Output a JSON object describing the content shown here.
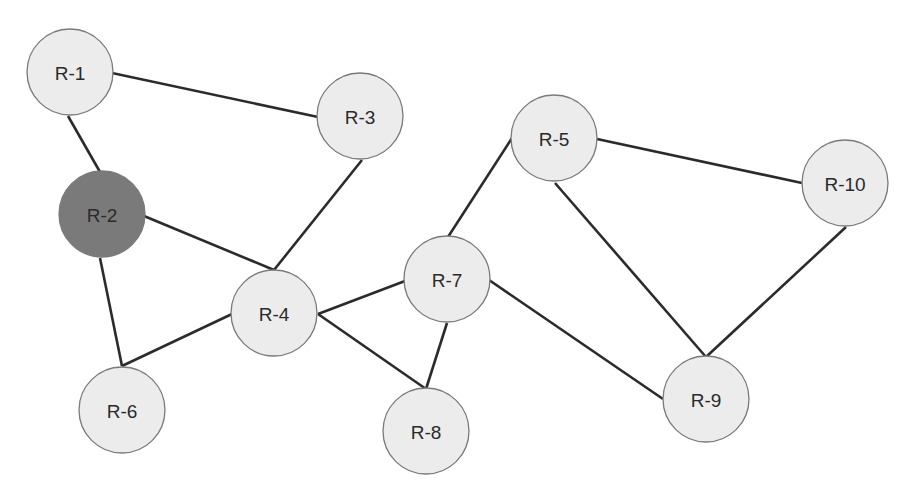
{
  "diagram": {
    "type": "network-graph",
    "colors": {
      "node_fill": "#ececec",
      "node_fill_highlighted": "#7a7a7a",
      "node_stroke": "#7a7a7a",
      "edge": "#2b2b2b",
      "label": "#2a2a2a"
    },
    "nodes": [
      {
        "id": "R-1",
        "label": "R-1",
        "x": 70,
        "y": 72,
        "highlighted": false
      },
      {
        "id": "R-2",
        "label": "R-2",
        "x": 102,
        "y": 214,
        "highlighted": true
      },
      {
        "id": "R-3",
        "label": "R-3",
        "x": 360,
        "y": 116,
        "highlighted": false
      },
      {
        "id": "R-4",
        "label": "R-4",
        "x": 274,
        "y": 313,
        "highlighted": false
      },
      {
        "id": "R-5",
        "label": "R-5",
        "x": 554,
        "y": 138,
        "highlighted": false
      },
      {
        "id": "R-6",
        "label": "R-6",
        "x": 122,
        "y": 410,
        "highlighted": false
      },
      {
        "id": "R-7",
        "label": "R-7",
        "x": 447,
        "y": 279,
        "highlighted": false
      },
      {
        "id": "R-8",
        "label": "R-8",
        "x": 426,
        "y": 431,
        "highlighted": false
      },
      {
        "id": "R-9",
        "label": "R-9",
        "x": 706,
        "y": 399,
        "highlighted": false
      },
      {
        "id": "R-10",
        "label": "R-10",
        "x": 845,
        "y": 183,
        "highlighted": false
      }
    ],
    "edges": [
      {
        "from": "R-1",
        "to": "R-2",
        "x1": 68,
        "y1": 116,
        "x2": 100,
        "y2": 172
      },
      {
        "from": "R-1",
        "to": "R-3",
        "x1": 112,
        "y1": 73,
        "x2": 318,
        "y2": 117
      },
      {
        "from": "R-2",
        "to": "R-4",
        "x1": 144,
        "y1": 216,
        "x2": 274,
        "y2": 270
      },
      {
        "from": "R-2",
        "to": "R-6",
        "x1": 100,
        "y1": 258,
        "x2": 122,
        "y2": 366
      },
      {
        "from": "R-3",
        "to": "R-4",
        "x1": 362,
        "y1": 160,
        "x2": 274,
        "y2": 270
      },
      {
        "from": "R-4",
        "to": "R-6",
        "x1": 232,
        "y1": 314,
        "x2": 122,
        "y2": 366
      },
      {
        "from": "R-4",
        "to": "R-7",
        "x1": 318,
        "y1": 314,
        "x2": 405,
        "y2": 281
      },
      {
        "from": "R-4",
        "to": "R-8",
        "x1": 318,
        "y1": 314,
        "x2": 426,
        "y2": 389
      },
      {
        "from": "R-7",
        "to": "R-8",
        "x1": 447,
        "y1": 323,
        "x2": 426,
        "y2": 389
      },
      {
        "from": "R-7",
        "to": "R-5",
        "x1": 448,
        "y1": 237,
        "x2": 512,
        "y2": 138
      },
      {
        "from": "R-7",
        "to": "R-9",
        "x1": 489,
        "y1": 280,
        "x2": 663,
        "y2": 399
      },
      {
        "from": "R-5",
        "to": "R-10",
        "x1": 597,
        "y1": 139,
        "x2": 802,
        "y2": 183
      },
      {
        "from": "R-5",
        "to": "R-9",
        "x1": 555,
        "y1": 183,
        "x2": 706,
        "y2": 357
      },
      {
        "from": "R-10",
        "to": "R-9",
        "x1": 846,
        "y1": 227,
        "x2": 706,
        "y2": 357
      }
    ]
  }
}
